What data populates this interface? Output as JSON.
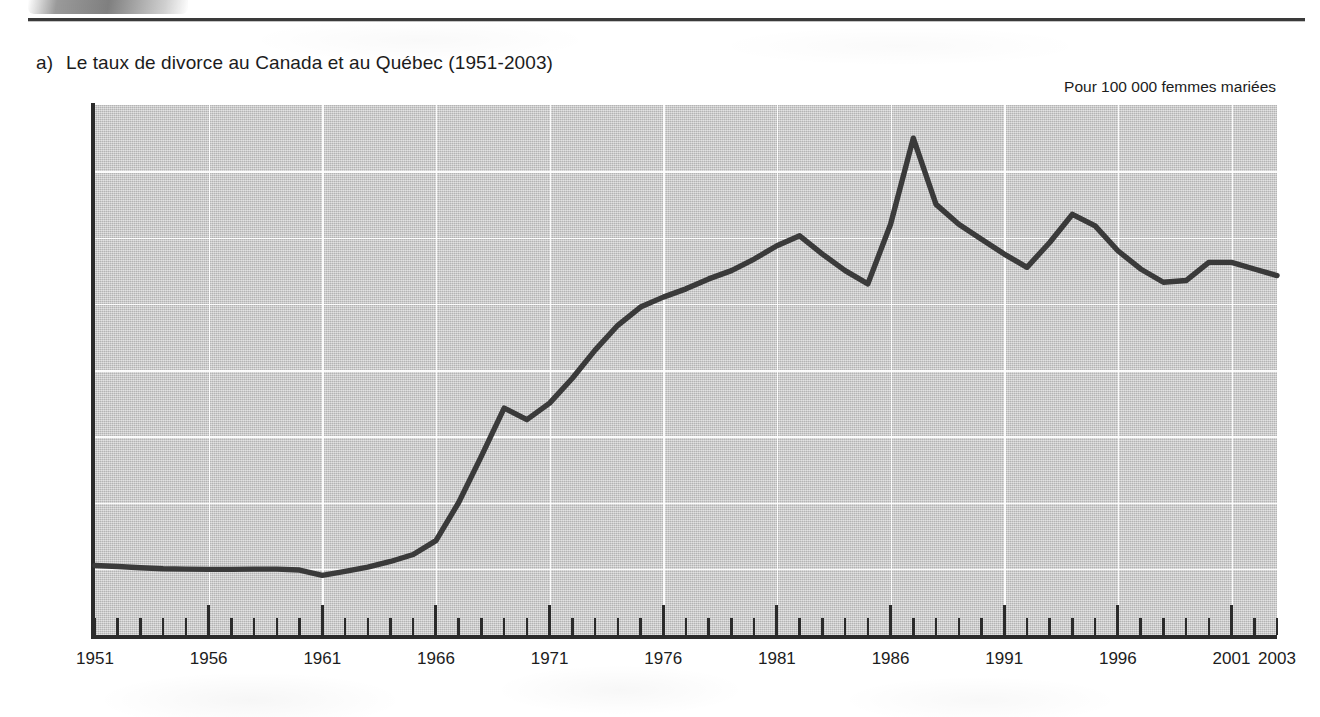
{
  "figure": {
    "marker": "a)",
    "title": "Le taux de divorce au Canada et au Québec (1951-2003)",
    "unit_caption": "Pour 100 000 femmes mariées"
  },
  "colors": {
    "line": "#3a3a3a",
    "axis": "#2b2b2b",
    "plot_background": "#c6c6c6",
    "gridline": "#ffffff",
    "text": "#1c1c1c"
  },
  "chart_data": {
    "type": "line",
    "title": "Le taux de divorce au Canada et au Québec (1951-2003)",
    "subtitle": "Pour 100 000 femmes mariées",
    "xlabel": "",
    "ylabel": "Pour 100 000 femmes mariées",
    "xlim": [
      1951,
      2003
    ],
    "ylim": [
      0,
      1600
    ],
    "grid": true,
    "legend": "none",
    "y_ticks": [
      0,
      200,
      400,
      600,
      800,
      1000,
      1200,
      1400,
      1600
    ],
    "y_tick_labels": [
      "0",
      "200",
      "400",
      "600",
      "800",
      "1 000",
      "1 200",
      "1 400",
      "1 600"
    ],
    "x_ticks_major": [
      1951,
      1956,
      1961,
      1966,
      1971,
      1976,
      1981,
      1986,
      1991,
      1996,
      2001,
      2003
    ],
    "x_tick_labels": [
      "1951",
      "1956",
      "1961",
      "1966",
      "1971",
      "1976",
      "1981",
      "1986",
      "1991",
      "1996",
      "2001",
      "2003"
    ],
    "x_minor_tick_interval": 1,
    "series": [
      {
        "name": "Taux de divorce",
        "x": [
          1951,
          1952,
          1953,
          1954,
          1955,
          1956,
          1957,
          1958,
          1959,
          1960,
          1961,
          1962,
          1963,
          1964,
          1965,
          1966,
          1967,
          1968,
          1969,
          1970,
          1971,
          1972,
          1973,
          1974,
          1975,
          1976,
          1977,
          1978,
          1979,
          1980,
          1981,
          1982,
          1983,
          1984,
          1985,
          1986,
          1987,
          1988,
          1989,
          1990,
          1991,
          1992,
          1993,
          1994,
          1995,
          1996,
          1997,
          1998,
          1999,
          2000,
          2001,
          2002,
          2003
        ],
        "values": [
          210,
          207,
          203,
          200,
          199,
          198,
          198,
          199,
          199,
          196,
          180,
          192,
          205,
          222,
          243,
          285,
          400,
          540,
          685,
          650,
          700,
          775,
          860,
          935,
          990,
          1020,
          1045,
          1075,
          1100,
          1135,
          1175,
          1205,
          1150,
          1100,
          1060,
          1240,
          1500,
          1300,
          1240,
          1195,
          1150,
          1110,
          1185,
          1270,
          1235,
          1160,
          1105,
          1065,
          1070,
          1125,
          1125,
          1105,
          1085
        ]
      }
    ]
  }
}
